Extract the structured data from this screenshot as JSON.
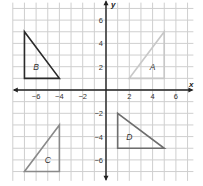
{
  "diagram": {
    "type": "coordinate_plane",
    "axes": {
      "x_label": "x",
      "y_label": "y",
      "x_ticks": [
        {
          "value": -6,
          "label": "−6"
        },
        {
          "value": -4,
          "label": "−4"
        },
        {
          "value": -2,
          "label": "−2"
        },
        {
          "value": 2,
          "label": "2"
        },
        {
          "value": 4,
          "label": "4"
        },
        {
          "value": 6,
          "label": "6"
        }
      ],
      "y_ticks": [
        {
          "value": 6,
          "label": "6"
        },
        {
          "value": 4,
          "label": "4"
        },
        {
          "value": 2,
          "label": "2"
        },
        {
          "value": -2,
          "label": "−2"
        },
        {
          "value": -4,
          "label": "−4"
        },
        {
          "value": -6,
          "label": "−6"
        }
      ],
      "x_range": [
        -8,
        7
      ],
      "y_range": [
        -7,
        7
      ],
      "grid": true
    },
    "shapes": [
      {
        "label": "A",
        "vertices": [
          [
            2,
            1
          ],
          [
            5,
            5
          ],
          [
            5,
            1
          ]
        ],
        "color": "#c8c8c8",
        "label_pos": [
          4,
          2
        ]
      },
      {
        "label": "B",
        "vertices": [
          [
            -7,
            5
          ],
          [
            -7,
            1
          ],
          [
            -4,
            1
          ]
        ],
        "color": "#2a2a2a",
        "label_pos": [
          -6,
          2
        ]
      },
      {
        "label": "C",
        "vertices": [
          [
            -4,
            -3
          ],
          [
            -7,
            -7
          ],
          [
            -4,
            -7
          ]
        ],
        "color": "#8a8a8a",
        "label_pos": [
          -5,
          -6
        ]
      },
      {
        "label": "D",
        "vertices": [
          [
            1,
            -2
          ],
          [
            1,
            -5
          ],
          [
            5,
            -5
          ]
        ],
        "color": "#6e6e6e",
        "label_pos": [
          2,
          -4
        ]
      }
    ]
  }
}
